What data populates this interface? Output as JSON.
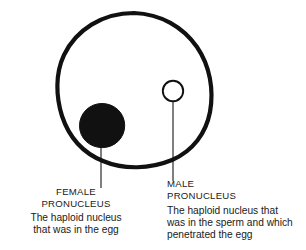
{
  "diagram": {
    "colors": {
      "ink": "#1a1a1a",
      "cell_outline": "#111111",
      "female_nucleus_fill": "#111111",
      "male_nucleus_fill": "#ffffff",
      "leader_line": "#555555",
      "background": "#ffffff"
    },
    "shapes": {
      "egg_cell": {
        "name": "egg-cell-outline",
        "stroke_width": 4.2,
        "bounds": {
          "x": 57,
          "y": 12,
          "width": 155,
          "height": 156
        }
      },
      "female_pronucleus": {
        "name": "female-pronucleus",
        "cx": 102,
        "cy": 126,
        "r": 22.5,
        "filled": true
      },
      "male_pronucleus": {
        "name": "male-pronucleus",
        "cx": 173,
        "cy": 91,
        "r": 10.5,
        "filled": false,
        "stroke_width": 1.8
      },
      "female_leader": {
        "name": "female-leader-line",
        "x": 101,
        "y1": 145,
        "y2": 188
      },
      "male_leader": {
        "name": "male-leader-line",
        "x": 173,
        "y1": 103,
        "y2": 181
      }
    }
  },
  "labels": {
    "female": {
      "title": "FEMALE\nPRONUCLEUS",
      "body": "The haploid nucleus\nthat was in the egg"
    },
    "male": {
      "title": "MALE\nPRONUCLEUS",
      "body": "The haploid nucleus that\nwas in the sperm and which\npenetrated the egg"
    }
  }
}
